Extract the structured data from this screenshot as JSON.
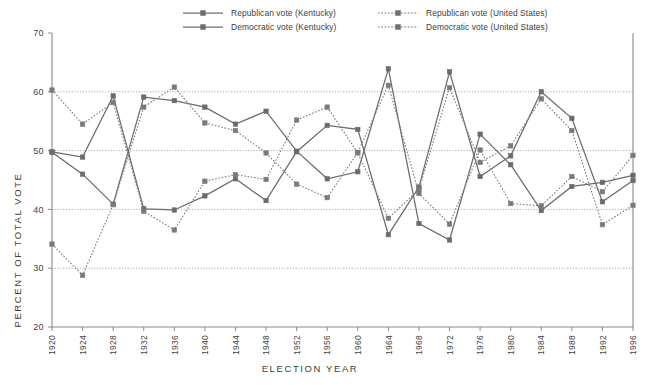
{
  "chart_data": {
    "type": "line",
    "title": "",
    "xlabel": "ELECTION YEAR",
    "ylabel": "PERCENT OF TOTAL VOTE",
    "ylim": [
      20,
      70
    ],
    "yticks": [
      20,
      30,
      40,
      50,
      60,
      70
    ],
    "grid": "horizontal-dotted",
    "legend_position": "top",
    "x": [
      1920,
      1924,
      1928,
      1932,
      1936,
      1940,
      1944,
      1948,
      1952,
      1956,
      1960,
      1964,
      1968,
      1972,
      1976,
      1980,
      1984,
      1988,
      1992,
      1996
    ],
    "categories": [
      "1920",
      "1924",
      "1928",
      "1932",
      "1936",
      "1940",
      "1944",
      "1948",
      "1952",
      "1956",
      "1960",
      "1964",
      "1968",
      "1972",
      "1976",
      "1980",
      "1984",
      "1988",
      "1992",
      "1996"
    ],
    "series": [
      {
        "name": "Republican vote (Kentucky)",
        "key": "rep_ky",
        "style": "solid",
        "color": "#6b6b6b",
        "marker": "square",
        "values": [
          49.8,
          48.9,
          59.3,
          40.1,
          39.9,
          42.3,
          45.2,
          41.5,
          49.8,
          54.3,
          53.6,
          35.7,
          43.8,
          63.4,
          45.6,
          49.1,
          60.0,
          55.5,
          41.3,
          44.9
        ]
      },
      {
        "name": "Democratic vote (Kentucky)",
        "key": "dem_ky",
        "style": "solid",
        "color": "#6b6b6b",
        "marker": "square",
        "values": [
          49.7,
          46.0,
          40.9,
          59.1,
          58.5,
          57.4,
          54.5,
          56.7,
          49.9,
          45.2,
          46.4,
          63.9,
          37.6,
          34.8,
          52.8,
          47.6,
          39.8,
          43.9,
          44.6,
          45.8
        ]
      },
      {
        "name": "Republican vote (United States)",
        "key": "rep_us",
        "style": "dotted",
        "color": "#7a7a7a",
        "marker": "square",
        "values": [
          60.3,
          54.5,
          58.2,
          39.7,
          36.5,
          44.8,
          45.9,
          45.1,
          55.2,
          57.4,
          49.6,
          38.5,
          43.4,
          60.7,
          48.0,
          50.8,
          58.8,
          53.4,
          37.4,
          40.7
        ]
      },
      {
        "name": "Democratic vote (United States)",
        "key": "dem_us",
        "style": "dotted",
        "color": "#7a7a7a",
        "marker": "square",
        "values": [
          34.1,
          28.8,
          40.8,
          57.4,
          60.8,
          54.7,
          53.4,
          49.6,
          44.3,
          42.0,
          49.7,
          61.1,
          42.7,
          37.5,
          50.1,
          41.0,
          40.6,
          45.6,
          43.0,
          49.2
        ]
      }
    ]
  },
  "legend": {
    "items": [
      {
        "label": "Republican vote (Kentucky)",
        "style": "solid"
      },
      {
        "label": "Democratic vote (Kentucky)",
        "style": "solid"
      },
      {
        "label": "Republican vote (United States)",
        "style": "dotted"
      },
      {
        "label": "Democratic vote (United States)",
        "style": "dotted"
      }
    ]
  }
}
